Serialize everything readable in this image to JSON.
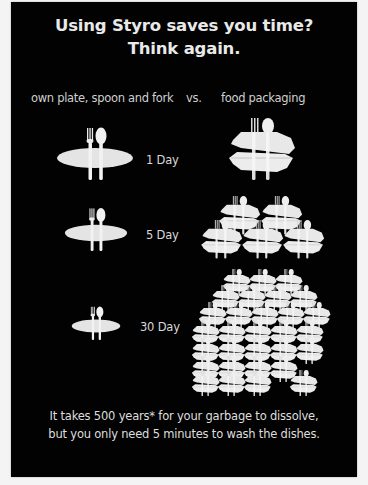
{
  "poster": {
    "title_line1": "Using Styro saves you time?",
    "title_line2": "Think again.",
    "column_left": "own plate, spoon and fork",
    "column_vs": "vs.",
    "column_right": "food packaging",
    "rows": [
      {
        "label": "1 Day",
        "plate_icon": "plate-with-fork-spoon-icon",
        "styro_containers": 1
      },
      {
        "label": "5 Day",
        "plate_icon": "plate-with-fork-spoon-icon",
        "styro_containers": 5
      },
      {
        "label": "30 Day",
        "plate_icon": "plate-with-fork-spoon-icon",
        "styro_containers": 30
      }
    ],
    "footer_line1": "It takes 500 years* for your garbage to dissolve,",
    "footer_line2": "but you only need 5 minutes to wash the dishes.",
    "colors": {
      "background": "#020202",
      "text": "#e9e9e9",
      "icon": "#e6e6e6",
      "page": "#f4f4f4"
    }
  }
}
